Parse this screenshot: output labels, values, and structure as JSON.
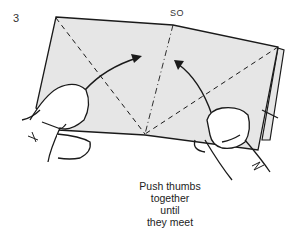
{
  "diagram": {
    "step_number": "3",
    "fold_label": "SO",
    "caption_lines": [
      "Push thumbs",
      "together",
      "until",
      "they meet"
    ],
    "colors": {
      "paper": "#e6e6e6",
      "line": "#1a1a1a",
      "background": "#ffffff"
    }
  }
}
